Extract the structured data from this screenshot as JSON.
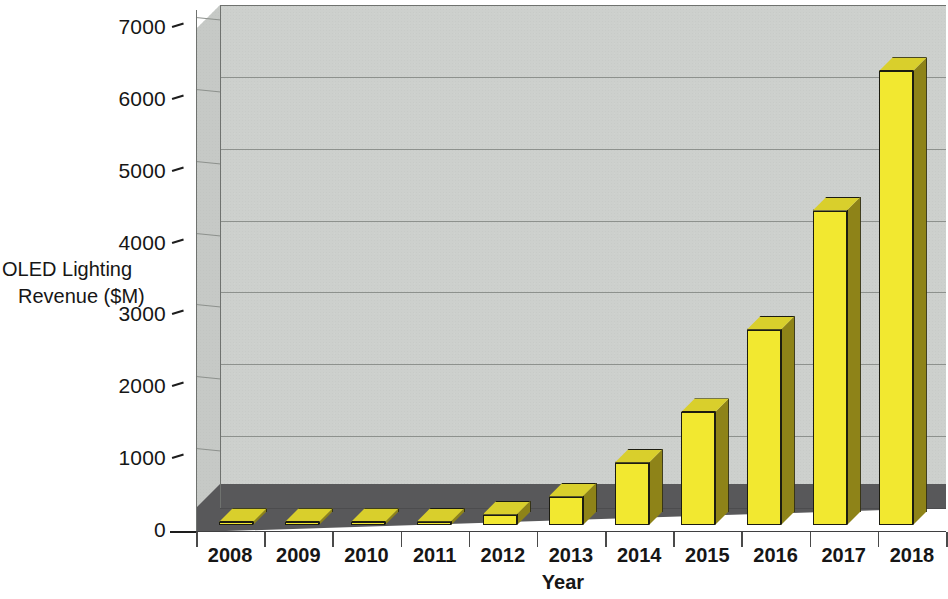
{
  "chart_data": {
    "type": "bar",
    "title": "",
    "subtitle": "",
    "xlabel": "Year",
    "ylabel": "OLED Lighting Revenue ($M)",
    "ylabel_line1": "OLED Lighting",
    "ylabel_line2": "Revenue ($M)",
    "categories": [
      "2008",
      "2009",
      "2010",
      "2011",
      "2012",
      "2013",
      "2014",
      "2015",
      "2016",
      "2017",
      "2018"
    ],
    "values": [
      10,
      15,
      25,
      50,
      150,
      400,
      870,
      1570,
      2720,
      4380,
      6320
    ],
    "series": [
      {
        "name": "OLED Lighting Revenue ($M)",
        "values": [
          10,
          15,
          25,
          50,
          150,
          400,
          870,
          1570,
          2720,
          4380,
          6320
        ]
      }
    ],
    "ylim": [
      0,
      7000
    ],
    "ytick_labels": [
      "0",
      "1000",
      "2000",
      "3000",
      "4000",
      "5000",
      "6000",
      "7000"
    ],
    "ytick_values": [
      0,
      1000,
      2000,
      3000,
      4000,
      5000,
      6000,
      7000
    ],
    "grid": true,
    "legend": false,
    "legend_position": "none",
    "style": "3d-column",
    "colors": {
      "bar_front": "#f2e830",
      "bar_side": "#8e8318",
      "bar_top": "#d9cf2c",
      "bar_outline": "#1c1c10",
      "panel_back": "#cdd0cd",
      "panel_left": "#c6c9c6",
      "floor": "#58585a",
      "gridline": "#8d918d",
      "text": "#161616",
      "background": "#ffffff"
    }
  }
}
